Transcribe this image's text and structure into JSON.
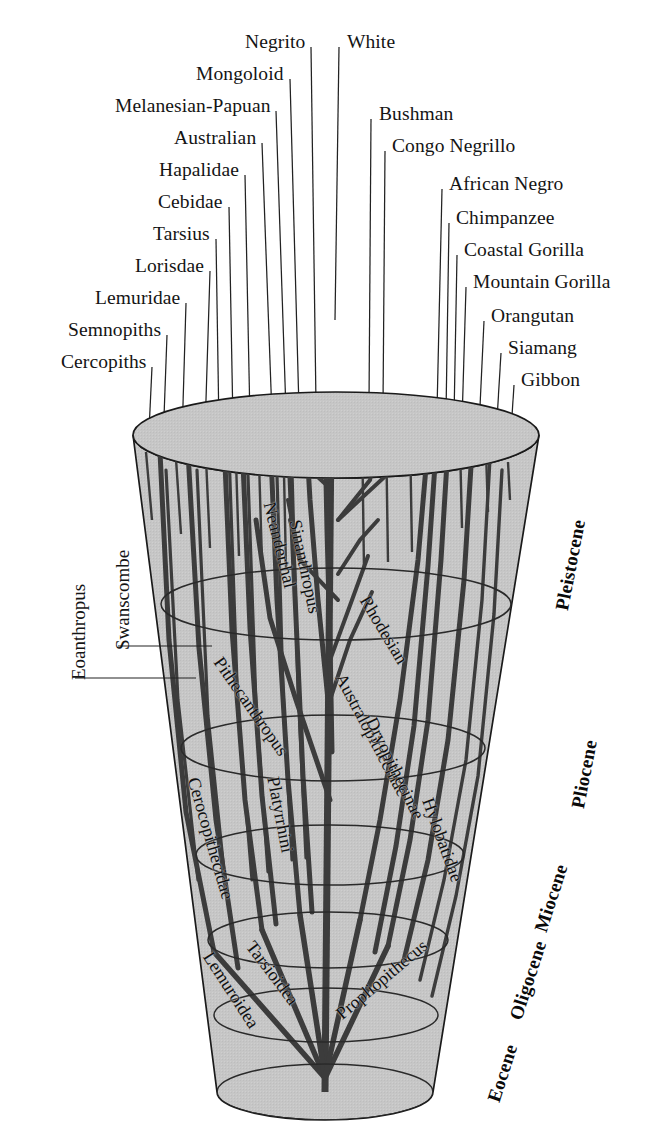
{
  "figure": {
    "colors": {
      "cone_fill": "#c6c6c6",
      "cone_stroke": "#1a1a1a",
      "branch": "#3a3a3a",
      "leader": "#222222",
      "text": "#141414",
      "background": "#ffffff"
    }
  },
  "top_labels_left": [
    {
      "label": "Negrito",
      "x": 238,
      "y": 32,
      "lx": 311,
      "ly": 47,
      "tipx": 316,
      "tipy": 404
    },
    {
      "label": "Mongoloid",
      "x": 186,
      "y": 64,
      "lx": 290,
      "ly": 79,
      "tipx": 299,
      "tipy": 409
    },
    {
      "label": "Melanesian-Papuan",
      "x": 74,
      "y": 96,
      "lx": 276,
      "ly": 111,
      "tipx": 286,
      "tipy": 412
    },
    {
      "label": "Australian",
      "x": 146,
      "y": 128,
      "lx": 262,
      "ly": 143,
      "tipx": 272,
      "tipy": 416
    },
    {
      "label": "Hapalidae",
      "x": 153,
      "y": 160,
      "lx": 245,
      "ly": 175,
      "tipx": 250,
      "tipy": 420
    },
    {
      "label": "Cebidae",
      "x": 168,
      "y": 192,
      "lx": 229,
      "ly": 207,
      "tipx": 233,
      "tipy": 424
    },
    {
      "label": "Tarsius",
      "x": 172,
      "y": 224,
      "lx": 216,
      "ly": 239,
      "tipx": 219,
      "tipy": 428
    },
    {
      "label": "Lorisdae",
      "x": 162,
      "y": 256,
      "lx": 210,
      "ly": 271,
      "tipx": 205,
      "tipy": 432
    },
    {
      "label": "Lemuridae",
      "x": 116,
      "y": 288,
      "lx": 186,
      "ly": 303,
      "tipx": 182,
      "tipy": 438
    },
    {
      "label": "Semnopiths",
      "x": 112,
      "y": 320,
      "lx": 167,
      "ly": 335,
      "tipx": 163,
      "tipy": 444
    },
    {
      "label": "Cercopiths",
      "x": 114,
      "y": 352,
      "lx": 152,
      "ly": 367,
      "tipx": 148,
      "tipy": 452
    }
  ],
  "top_labels_right": [
    {
      "label": "White",
      "x": 347,
      "y": 32,
      "lx": 339,
      "ly": 47,
      "tipx": 335,
      "tipy": 320
    },
    {
      "label": "Bushman",
      "x": 379,
      "y": 104,
      "lx": 371,
      "ly": 119,
      "tipx": 369,
      "tipy": 404
    },
    {
      "label": "Congo Negrillo",
      "x": 392,
      "y": 136,
      "lx": 385,
      "ly": 151,
      "tipx": 383,
      "tipy": 406
    },
    {
      "label": "African Negro",
      "x": 449,
      "y": 174,
      "lx": 442,
      "ly": 189,
      "tipx": 437,
      "tipy": 411
    },
    {
      "label": "Chimpanzee",
      "x": 456,
      "y": 208,
      "lx": 449,
      "ly": 223,
      "tipx": 446,
      "tipy": 414
    },
    {
      "label": "Coastal Gorilla",
      "x": 464,
      "y": 240,
      "lx": 457,
      "ly": 255,
      "tipx": 454,
      "tipy": 418
    },
    {
      "label": "Mountain Gorilla",
      "x": 473,
      "y": 272,
      "lx": 466,
      "ly": 287,
      "tipx": 462,
      "tipy": 422
    },
    {
      "label": "Orangutan",
      "x": 491,
      "y": 306,
      "lx": 484,
      "ly": 321,
      "tipx": 479,
      "tipy": 428
    },
    {
      "label": "Siamang",
      "x": 508,
      "y": 338,
      "lx": 501,
      "ly": 353,
      "tipx": 496,
      "tipy": 436
    },
    {
      "label": "Gibbon",
      "x": 521,
      "y": 370,
      "lx": 514,
      "ly": 385,
      "tipx": 510,
      "tipy": 447
    }
  ],
  "left_side_labels": [
    {
      "label": "Eoanthropus",
      "x": 68,
      "y": 680,
      "rotate": -90,
      "leader": {
        "x1": 75,
        "y1": 678,
        "x2": 196,
        "y2": 678
      }
    },
    {
      "label": "Swanscombe",
      "x": 112,
      "y": 650,
      "rotate": -90,
      "leader": {
        "x1": 118,
        "y1": 646,
        "x2": 212,
        "y2": 646
      }
    }
  ],
  "epoch_labels": [
    {
      "label": "Pleistocene",
      "x": 551,
      "y": 608,
      "rotate": -79
    },
    {
      "label": "Pliocene",
      "x": 567,
      "y": 806,
      "rotate": -79
    },
    {
      "label": "Miocene",
      "x": 530,
      "y": 928,
      "rotate": -72
    },
    {
      "label": "Oligocene",
      "x": 505,
      "y": 1016,
      "rotate": -72
    },
    {
      "label": "Eocene",
      "x": 483,
      "y": 1098,
      "rotate": -72
    }
  ],
  "inner_labels": [
    {
      "label": "Neanderthal",
      "x": 279,
      "y": 500,
      "rotate": 76
    },
    {
      "label": "Sinanthropus",
      "x": 305,
      "y": 518,
      "rotate": 78
    },
    {
      "label": "Pithecanthropus",
      "x": 226,
      "y": 653,
      "rotate": 55
    },
    {
      "label": "Rhodesian",
      "x": 373,
      "y": 592,
      "rotate": 59
    },
    {
      "label": "Australopithecinae",
      "x": 349,
      "y": 670,
      "rotate": 62
    },
    {
      "label": "Dryopithecinae",
      "x": 380,
      "y": 714,
      "rotate": 64
    },
    {
      "label": "Hylobatidae",
      "x": 437,
      "y": 795,
      "rotate": 70
    },
    {
      "label": "Cerocopithecidae",
      "x": 203,
      "y": 775,
      "rotate": 74
    },
    {
      "label": "Platyrrhini",
      "x": 283,
      "y": 775,
      "rotate": 79
    },
    {
      "label": "Tarsioidea",
      "x": 258,
      "y": 937,
      "rotate": 53
    },
    {
      "label": "Lemuroidea",
      "x": 216,
      "y": 948,
      "rotate": 57
    },
    {
      "label": "Propliopithecus",
      "x": 332,
      "y": 1008,
      "rotate": -40
    }
  ],
  "cone": {
    "top_ellipse": {
      "cx": 336,
      "cy": 435,
      "rx": 203,
      "ry": 43
    },
    "bottom_ellipse": {
      "cx": 325,
      "cy": 1092,
      "rx": 108,
      "ry": 28
    },
    "rings": [
      {
        "cx": 336,
        "cy": 604,
        "rx": 175,
        "ry": 36
      },
      {
        "cx": 333,
        "cy": 748,
        "rx": 152,
        "ry": 33
      },
      {
        "cx": 330,
        "cy": 855,
        "rx": 134,
        "ry": 30
      },
      {
        "cx": 328,
        "cy": 940,
        "rx": 120,
        "ry": 28
      },
      {
        "cx": 326,
        "cy": 1015,
        "rx": 112,
        "ry": 27
      }
    ]
  }
}
